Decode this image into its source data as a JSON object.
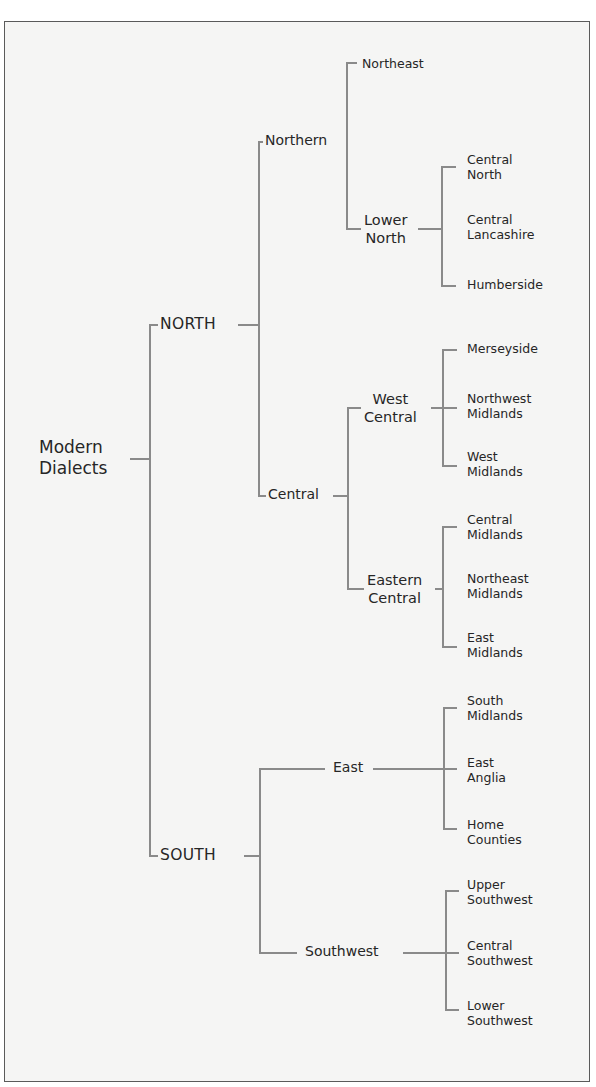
{
  "diagram": {
    "type": "tree",
    "root": {
      "label_lines": [
        "Modern",
        "Dialects"
      ]
    },
    "nodes": {
      "north": {
        "label": "NORTH"
      },
      "south": {
        "label": "SOUTH"
      },
      "northern": {
        "label": "Northern"
      },
      "central": {
        "label": "Central"
      },
      "east": {
        "label": "East"
      },
      "southwest": {
        "label": "Southwest"
      },
      "northeast": {
        "label": "Northeast"
      },
      "lower_north": {
        "label_lines": [
          "Lower",
          "North"
        ]
      },
      "west_central": {
        "label_lines": [
          "West",
          "Central"
        ]
      },
      "eastern_central": {
        "label_lines": [
          "Eastern",
          "Central"
        ]
      }
    },
    "leaves": {
      "central_north": [
        "Central",
        "North"
      ],
      "central_lancashire": [
        "Central",
        "Lancashire"
      ],
      "humberside": [
        "Humberside"
      ],
      "merseyside": [
        "Merseyside"
      ],
      "northwest_midlands": [
        "Northwest",
        "Midlands"
      ],
      "west_midlands": [
        "West",
        "Midlands"
      ],
      "central_midlands": [
        "Central",
        "Midlands"
      ],
      "northeast_midlands": [
        "Northeast",
        "Midlands"
      ],
      "east_midlands": [
        "East",
        "Midlands"
      ],
      "south_midlands": [
        "South",
        "Midlands"
      ],
      "east_anglia": [
        "East",
        "Anglia"
      ],
      "home_counties": [
        "Home",
        "Counties"
      ],
      "upper_southwest": [
        "Upper",
        "Southwest"
      ],
      "central_southwest": [
        "Central",
        "Southwest"
      ],
      "lower_southwest": [
        "Lower",
        "Southwest"
      ]
    },
    "hierarchy": {
      "Modern Dialects": {
        "NORTH": {
          "Northern": {
            "Northeast": {},
            "Lower North": [
              "Central North",
              "Central Lancashire",
              "Humberside"
            ]
          },
          "Central": {
            "West Central": [
              "Merseyside",
              "Northwest Midlands",
              "West Midlands"
            ],
            "Eastern Central": [
              "Central Midlands",
              "Northeast Midlands",
              "East Midlands"
            ]
          }
        },
        "SOUTH": {
          "East": [
            "South Midlands",
            "East Anglia",
            "Home Counties"
          ],
          "Southwest": [
            "Upper Southwest",
            "Central Southwest",
            "Lower Southwest"
          ]
        }
      }
    },
    "colors": {
      "line": "#8a8a8a",
      "text": "#262626",
      "background": "#f5f5f4",
      "border": "#5a5a5a"
    }
  }
}
